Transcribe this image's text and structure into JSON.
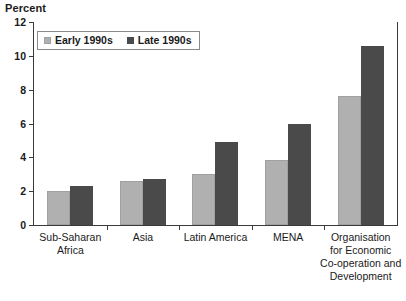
{
  "chart_data": {
    "type": "bar",
    "title": "Percent",
    "xlabel": "",
    "ylabel": "Percent",
    "ylim": [
      0,
      12
    ],
    "yticks": [
      0,
      2,
      4,
      6,
      8,
      10,
      12
    ],
    "grid": false,
    "legend_position": "top-left",
    "categories": [
      "Sub-Saharan Africa",
      "Asia",
      "Latin America",
      "MENA",
      "Organisation for Economic Co-operation and Development"
    ],
    "category_lines": [
      [
        "Sub-Saharan",
        "Africa"
      ],
      [
        "Asia"
      ],
      [
        "Latin America"
      ],
      [
        "MENA"
      ],
      [
        "Organisation",
        "for Economic",
        "Co-operation and",
        "Development"
      ]
    ],
    "series": [
      {
        "name": "Early 1990s",
        "color": "#b0b0b0",
        "values": [
          2.0,
          2.6,
          3.0,
          3.85,
          7.6
        ]
      },
      {
        "name": "Late 1990s",
        "color": "#4a4a4a",
        "values": [
          2.3,
          2.7,
          4.9,
          6.0,
          10.6
        ]
      }
    ]
  },
  "legend": {
    "items": [
      {
        "label": "Early 1990s"
      },
      {
        "label": "Late 1990s"
      }
    ]
  },
  "axis": {
    "title": "Percent"
  }
}
